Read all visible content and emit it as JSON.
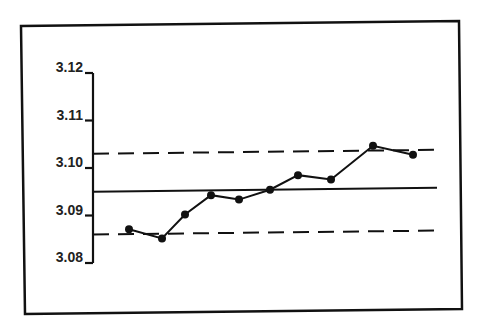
{
  "chart_data": {
    "type": "line",
    "title": "",
    "xlabel": "",
    "ylabel": "",
    "ylim": [
      3.08,
      3.12
    ],
    "y_ticks": [
      3.08,
      3.09,
      3.1,
      3.11,
      3.12
    ],
    "y_tick_labels": [
      "3.08",
      "3.09",
      "3.10",
      "3.11",
      "3.12"
    ],
    "grid": false,
    "legend": null,
    "x": [
      1,
      2,
      3,
      4,
      5,
      6,
      7,
      8,
      9,
      10
    ],
    "series": [
      {
        "name": "measurements",
        "style": "line-with-markers",
        "values": [
          3.087,
          3.085,
          3.09,
          3.094,
          3.093,
          3.095,
          3.098,
          3.097,
          3.104,
          3.102
        ]
      }
    ],
    "reference_lines": [
      {
        "name": "upper-control-limit",
        "style": "dashed",
        "value": 3.103
      },
      {
        "name": "center-line",
        "style": "solid",
        "value": 3.095
      },
      {
        "name": "lower-control-limit",
        "style": "dashed",
        "value": 3.086
      }
    ],
    "colors": {
      "ink": "#111111",
      "background": "#ffffff"
    }
  }
}
